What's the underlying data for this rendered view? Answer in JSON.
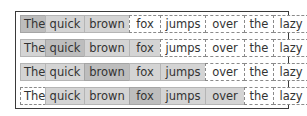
{
  "diagram": {
    "title": "",
    "tokens": [
      "The",
      "quick",
      "brown",
      "fox",
      "jumps",
      "over",
      "the",
      "lazy",
      "dog"
    ],
    "rows": [
      {
        "states": [
          "focus",
          "ctx",
          "ctx",
          "out",
          "out",
          "out",
          "out",
          "out",
          "out"
        ]
      },
      {
        "states": [
          "ctx",
          "focus",
          "ctx",
          "ctx",
          "out",
          "out",
          "out",
          "out",
          "out"
        ]
      },
      {
        "states": [
          "ctx",
          "ctx",
          "focus",
          "ctx",
          "ctx",
          "out",
          "out",
          "out",
          "out"
        ]
      },
      {
        "states": [
          "out",
          "ctx",
          "ctx",
          "focus",
          "ctx",
          "ctx",
          "out",
          "out",
          "out"
        ]
      }
    ],
    "legend": {
      "focus": "center token (darker gray)",
      "ctx": "context window token (light gray)",
      "out": "outside window (dashed outline)"
    },
    "colors": {
      "focus": "#bdbdbd",
      "context": "#d4d4d4",
      "outside": "#ffffff",
      "frame": "#3a3a3a",
      "dashed_border": "#8a8a8a"
    }
  }
}
